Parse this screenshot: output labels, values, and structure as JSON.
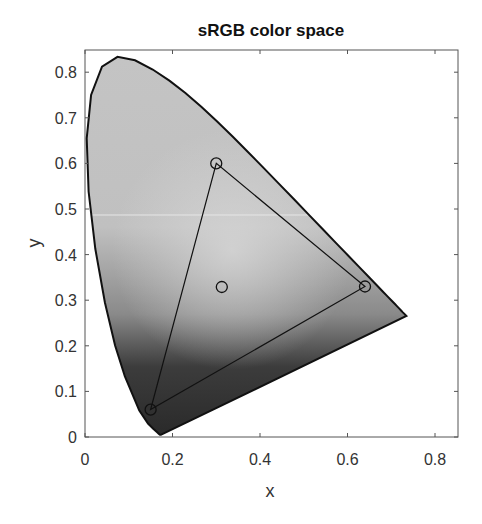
{
  "chart_data": {
    "type": "scatter",
    "title": "sRGB color space",
    "xlabel": "x",
    "ylabel": "y",
    "xlim": [
      0,
      0.85
    ],
    "ylim": [
      0,
      0.85
    ],
    "xticks": [
      "0",
      "0.2",
      "0.4",
      "0.6",
      "0.8"
    ],
    "yticks": [
      "0",
      "0.1",
      "0.2",
      "0.3",
      "0.4",
      "0.5",
      "0.6",
      "0.7",
      "0.8"
    ],
    "grid": false,
    "legend": null,
    "series": [
      {
        "name": "spectral locus",
        "kind": "filled-curve",
        "points": [
          [
            0.1741,
            0.005
          ],
          [
            0.1738,
            0.0049
          ],
          [
            0.1733,
            0.0048
          ],
          [
            0.1726,
            0.0048
          ],
          [
            0.1714,
            0.0051
          ],
          [
            0.1689,
            0.0069
          ],
          [
            0.1644,
            0.0109
          ],
          [
            0.1566,
            0.0177
          ],
          [
            0.144,
            0.0297
          ],
          [
            0.1241,
            0.0578
          ],
          [
            0.0913,
            0.1327
          ],
          [
            0.0687,
            0.2007
          ],
          [
            0.0454,
            0.295
          ],
          [
            0.0235,
            0.4127
          ],
          [
            0.0082,
            0.5384
          ],
          [
            0.0039,
            0.6548
          ],
          [
            0.0139,
            0.7502
          ],
          [
            0.0389,
            0.812
          ],
          [
            0.0743,
            0.8338
          ],
          [
            0.1142,
            0.8262
          ],
          [
            0.1547,
            0.8059
          ],
          [
            0.1929,
            0.7816
          ],
          [
            0.2296,
            0.7543
          ],
          [
            0.2658,
            0.7243
          ],
          [
            0.3016,
            0.6923
          ],
          [
            0.3373,
            0.6589
          ],
          [
            0.3731,
            0.6245
          ],
          [
            0.4087,
            0.5896
          ],
          [
            0.4441,
            0.5547
          ],
          [
            0.4788,
            0.5202
          ],
          [
            0.5125,
            0.4866
          ],
          [
            0.5448,
            0.4544
          ],
          [
            0.5752,
            0.4242
          ],
          [
            0.6029,
            0.3965
          ],
          [
            0.627,
            0.3725
          ],
          [
            0.6482,
            0.3514
          ],
          [
            0.6658,
            0.334
          ],
          [
            0.6801,
            0.3197
          ],
          [
            0.6915,
            0.3083
          ],
          [
            0.7006,
            0.2993
          ],
          [
            0.7079,
            0.292
          ],
          [
            0.714,
            0.2859
          ],
          [
            0.719,
            0.2809
          ],
          [
            0.723,
            0.277
          ],
          [
            0.726,
            0.274
          ],
          [
            0.7283,
            0.2717
          ],
          [
            0.73,
            0.27
          ],
          [
            0.7347,
            0.2653
          ],
          [
            0.1741,
            0.005
          ]
        ]
      },
      {
        "name": "sRGB gamut",
        "kind": "triangle",
        "points": [
          [
            0.64,
            0.33
          ],
          [
            0.3,
            0.6
          ],
          [
            0.15,
            0.06
          ]
        ]
      },
      {
        "name": "primaries",
        "kind": "markers",
        "marker": "circle",
        "points": [
          [
            0.64,
            0.33
          ],
          [
            0.3,
            0.6
          ],
          [
            0.15,
            0.06
          ]
        ]
      },
      {
        "name": "white point D65",
        "kind": "markers",
        "marker": "circle",
        "points": [
          [
            0.3127,
            0.329
          ]
        ]
      }
    ]
  }
}
